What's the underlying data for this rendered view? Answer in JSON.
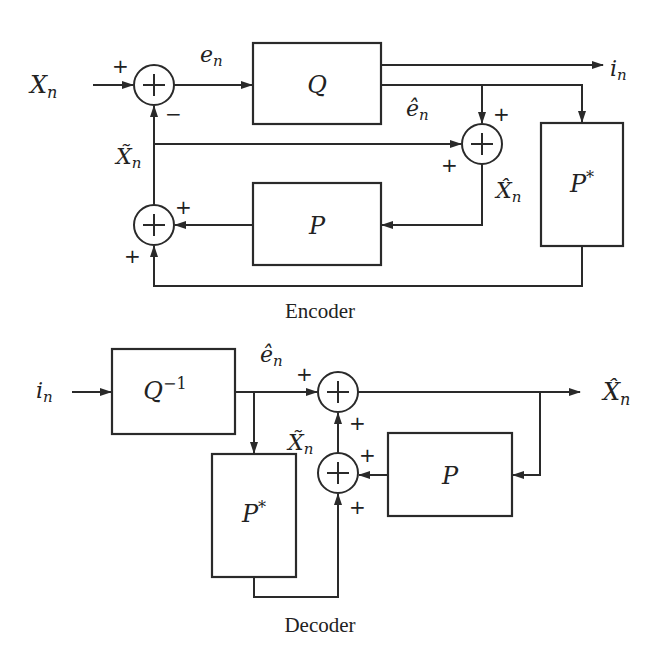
{
  "encoder": {
    "caption": "Encoder",
    "input_label": "X",
    "input_sub": "n",
    "error_label": "e",
    "error_sub": "n",
    "quantizer_label": "Q",
    "index_label": "i",
    "index_sub": "n",
    "quant_error_label": "ê",
    "quant_error_sub": "n",
    "prediction_label": "X̃",
    "prediction_sub": "n",
    "reconstruction_label": "X̂",
    "reconstruction_sub": "n",
    "predictor_label": "P",
    "pstar_label": "P",
    "pstar_sup": "*",
    "sum1_signs": {
      "left": "+",
      "bottom": "−"
    },
    "sum2_signs": {
      "right": "+",
      "bottom": "+"
    },
    "sum3_signs": {
      "top": "+",
      "left": "+"
    }
  },
  "decoder": {
    "caption": "Decoder",
    "input_label": "i",
    "input_sub": "n",
    "dequantizer_label": "Q",
    "dequantizer_sup": "−1",
    "quant_error_label": "ê",
    "quant_error_sub": "n",
    "prediction_label": "X̃",
    "prediction_sub": "n",
    "output_label": "X̂",
    "output_sub": "n",
    "predictor_label": "P",
    "pstar_label": "P",
    "pstar_sup": "*",
    "sum4_signs": {
      "left": "+",
      "bottom": "+"
    },
    "sum5_signs": {
      "right": "+",
      "bottom": "+"
    }
  },
  "sum_symbol": "+"
}
